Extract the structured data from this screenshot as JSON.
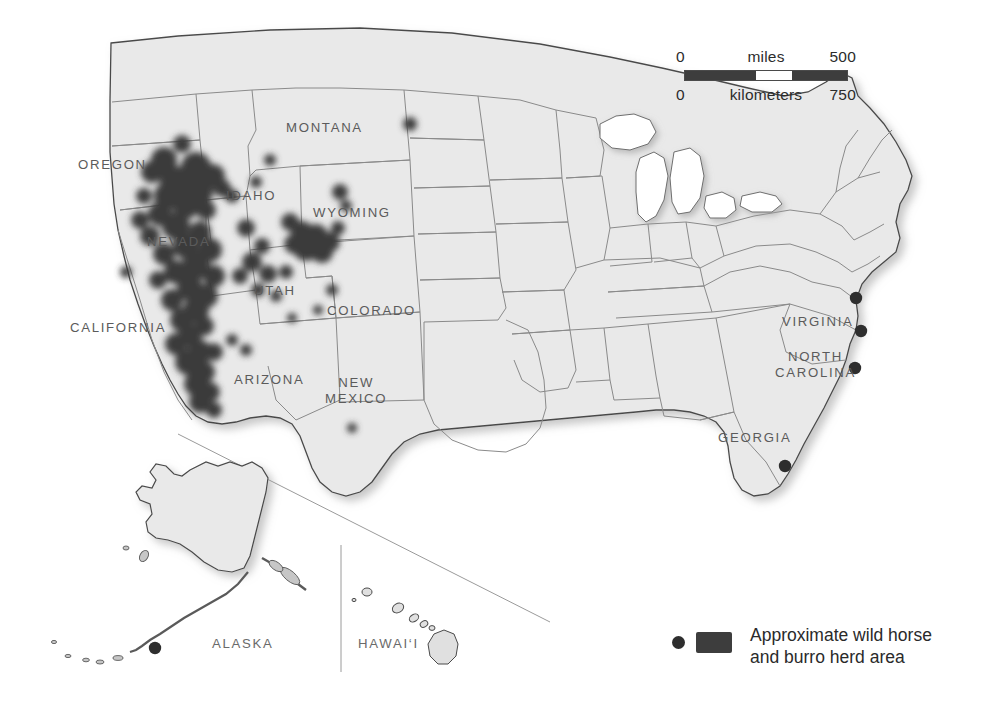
{
  "figure": {
    "background_color": "#ffffff",
    "land_fill": "#e9e9e9",
    "border_color": "#7d7d7d",
    "coast_color": "#4a4a4a",
    "herd_color": "#3d3d3d",
    "label_color": "#5b5b5b"
  },
  "scale_bar": {
    "miles": {
      "min": "0",
      "unit": "miles",
      "max": "500"
    },
    "kilometers": {
      "min": "0",
      "unit": "kilometers",
      "max": "750"
    },
    "segments": [
      "dark",
      "light",
      "dark"
    ]
  },
  "legend": {
    "dot_icon": "herd-point-icon",
    "swatch_icon": "herd-area-swatch-icon",
    "line1": "Approximate wild horse",
    "line2": "and burro herd area"
  },
  "state_labels": [
    {
      "name": "oregon",
      "text": "OREGON",
      "x": 78,
      "y": 157
    },
    {
      "name": "montana",
      "text": "MONTANA",
      "x": 286,
      "y": 120
    },
    {
      "name": "idaho",
      "text": "IDAHO",
      "x": 226,
      "y": 188
    },
    {
      "name": "wyoming",
      "text": "WYOMING",
      "x": 313,
      "y": 205
    },
    {
      "name": "nevada",
      "text": "NEVADA",
      "x": 147,
      "y": 234
    },
    {
      "name": "utah",
      "text": "UTAH",
      "x": 254,
      "y": 283
    },
    {
      "name": "colorado",
      "text": "COLORADO",
      "x": 327,
      "y": 303
    },
    {
      "name": "california",
      "text": "CALIFORNIA",
      "x": 70,
      "y": 320
    },
    {
      "name": "arizona",
      "text": "ARIZONA",
      "x": 234,
      "y": 372
    },
    {
      "name": "virginia",
      "text": "VIRGINIA",
      "x": 782,
      "y": 314
    },
    {
      "name": "georgia",
      "text": "GEORGIA",
      "x": 718,
      "y": 430
    }
  ],
  "state_labels_multiline": [
    {
      "name": "new-mexico",
      "lines": [
        "NEW",
        "MEXICO"
      ],
      "x": 325,
      "y": 375
    },
    {
      "name": "north-carolina",
      "lines": [
        "NORTH",
        "CAROLINA"
      ],
      "x": 775,
      "y": 349
    }
  ],
  "inset_labels": [
    {
      "name": "alaska",
      "text": "ALASKA",
      "x": 212,
      "y": 636
    },
    {
      "name": "hawaii",
      "text": "HAWAI‘I",
      "x": 358,
      "y": 636
    }
  ],
  "chart_data": {
    "type": "map",
    "projection": "albers-usa",
    "title": "Approximate wild horse and burro herd area",
    "herd_regions_note": "Dense clustered herd areas concentrated in Nevada, eastern Oregon, southern Idaho, western Utah, central Wyoming, northwestern Arizona and eastern California",
    "herd_blobs": [
      {
        "x": 182,
        "y": 144,
        "r": 9
      },
      {
        "x": 164,
        "y": 160,
        "r": 13
      },
      {
        "x": 196,
        "y": 167,
        "r": 15
      },
      {
        "x": 213,
        "y": 176,
        "r": 12
      },
      {
        "x": 176,
        "y": 182,
        "r": 16
      },
      {
        "x": 152,
        "y": 172,
        "r": 11
      },
      {
        "x": 200,
        "y": 192,
        "r": 13
      },
      {
        "x": 222,
        "y": 188,
        "r": 9
      },
      {
        "x": 168,
        "y": 196,
        "r": 14
      },
      {
        "x": 144,
        "y": 196,
        "r": 8
      },
      {
        "x": 186,
        "y": 206,
        "r": 13
      },
      {
        "x": 206,
        "y": 210,
        "r": 10
      },
      {
        "x": 160,
        "y": 214,
        "r": 12
      },
      {
        "x": 140,
        "y": 220,
        "r": 9
      },
      {
        "x": 176,
        "y": 226,
        "r": 14
      },
      {
        "x": 200,
        "y": 232,
        "r": 11
      },
      {
        "x": 150,
        "y": 236,
        "r": 10
      },
      {
        "x": 186,
        "y": 246,
        "r": 13
      },
      {
        "x": 210,
        "y": 250,
        "r": 12
      },
      {
        "x": 164,
        "y": 254,
        "r": 11
      },
      {
        "x": 196,
        "y": 266,
        "r": 14
      },
      {
        "x": 176,
        "y": 272,
        "r": 12
      },
      {
        "x": 214,
        "y": 276,
        "r": 11
      },
      {
        "x": 158,
        "y": 280,
        "r": 9
      },
      {
        "x": 190,
        "y": 288,
        "r": 13
      },
      {
        "x": 206,
        "y": 296,
        "r": 12
      },
      {
        "x": 172,
        "y": 300,
        "r": 11
      },
      {
        "x": 196,
        "y": 310,
        "r": 13
      },
      {
        "x": 182,
        "y": 320,
        "r": 12
      },
      {
        "x": 204,
        "y": 326,
        "r": 10
      },
      {
        "x": 190,
        "y": 336,
        "r": 12
      },
      {
        "x": 176,
        "y": 344,
        "r": 11
      },
      {
        "x": 200,
        "y": 352,
        "r": 12
      },
      {
        "x": 188,
        "y": 362,
        "r": 13
      },
      {
        "x": 204,
        "y": 372,
        "r": 11
      },
      {
        "x": 196,
        "y": 384,
        "r": 12
      },
      {
        "x": 210,
        "y": 392,
        "r": 10
      },
      {
        "x": 200,
        "y": 402,
        "r": 11
      },
      {
        "x": 214,
        "y": 410,
        "r": 8
      },
      {
        "x": 246,
        "y": 228,
        "r": 9
      },
      {
        "x": 262,
        "y": 246,
        "r": 8
      },
      {
        "x": 252,
        "y": 262,
        "r": 10
      },
      {
        "x": 268,
        "y": 274,
        "r": 9
      },
      {
        "x": 240,
        "y": 276,
        "r": 8
      },
      {
        "x": 258,
        "y": 290,
        "r": 7
      },
      {
        "x": 276,
        "y": 296,
        "r": 6
      },
      {
        "x": 286,
        "y": 272,
        "r": 7
      },
      {
        "x": 232,
        "y": 196,
        "r": 7
      },
      {
        "x": 256,
        "y": 182,
        "r": 6
      },
      {
        "x": 290,
        "y": 222,
        "r": 9
      },
      {
        "x": 302,
        "y": 232,
        "r": 11
      },
      {
        "x": 316,
        "y": 236,
        "r": 12
      },
      {
        "x": 330,
        "y": 242,
        "r": 10
      },
      {
        "x": 306,
        "y": 248,
        "r": 13
      },
      {
        "x": 322,
        "y": 252,
        "r": 11
      },
      {
        "x": 294,
        "y": 244,
        "r": 10
      },
      {
        "x": 338,
        "y": 228,
        "r": 7
      },
      {
        "x": 340,
        "y": 192,
        "r": 8
      },
      {
        "x": 346,
        "y": 206,
        "r": 6
      },
      {
        "x": 410,
        "y": 124,
        "r": 7
      },
      {
        "x": 270,
        "y": 160,
        "r": 6
      },
      {
        "x": 232,
        "y": 340,
        "r": 6
      },
      {
        "x": 246,
        "y": 350,
        "r": 6
      },
      {
        "x": 332,
        "y": 290,
        "r": 6
      },
      {
        "x": 352,
        "y": 428,
        "r": 5
      },
      {
        "x": 318,
        "y": 310,
        "r": 5
      },
      {
        "x": 292,
        "y": 318,
        "r": 5
      },
      {
        "x": 126,
        "y": 272,
        "r": 6
      },
      {
        "x": 214,
        "y": 352,
        "r": 9
      }
    ],
    "herd_points": [
      {
        "name": "chincoteague-assateague",
        "x": 856,
        "y": 298
      },
      {
        "name": "outer-banks-north",
        "x": 861,
        "y": 331
      },
      {
        "name": "outer-banks-south",
        "x": 855,
        "y": 368
      },
      {
        "name": "cumberland-island",
        "x": 785,
        "y": 466
      },
      {
        "name": "alaska-aleutian",
        "x": 155,
        "y": 648
      },
      {
        "name": "hawaii-big-island",
        "x": 444,
        "y": 642
      }
    ]
  }
}
